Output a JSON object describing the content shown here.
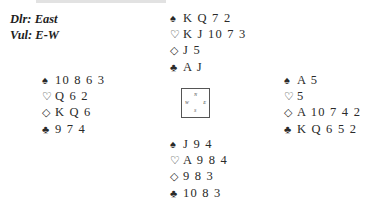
{
  "deal_info": {
    "dealer": "Dlr: East",
    "vulnerability": "Vul: E-W"
  },
  "suits": {
    "spades": "♠",
    "hearts": "♡",
    "diamonds": "◇",
    "clubs": "♣"
  },
  "hands": {
    "north": {
      "spades": "K Q 7 2",
      "hearts": "K J 10 7 3",
      "diamonds": "J 5",
      "clubs": "A J"
    },
    "west": {
      "spades": "10 8 6 3",
      "hearts": "Q 6 2",
      "diamonds": "K Q 6",
      "clubs": "9 7 4"
    },
    "east": {
      "spades": "A 5",
      "hearts": "5",
      "diamonds": "A 10 7 4 2",
      "clubs": "K Q 6 5 2"
    },
    "south": {
      "spades": "J 9 4",
      "hearts": "A 9 8 4",
      "diamonds": "9 8 3",
      "clubs": "10 8 3"
    }
  },
  "compass": {
    "n": "N",
    "w": "W",
    "e": "E",
    "s": "S"
  }
}
